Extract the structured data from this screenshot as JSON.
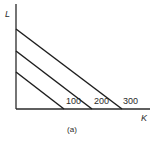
{
  "figure": {
    "caption": "(a)",
    "y_axis_label": "L",
    "x_axis_label": "K"
  },
  "chart_data": {
    "type": "line",
    "title": "",
    "xlabel": "K",
    "ylabel": "L",
    "caption": "(a)",
    "grid": false,
    "legend": "none",
    "series": [
      {
        "name": "100",
        "label": "100",
        "points": [
          [
            0,
            1
          ],
          [
            1,
            0
          ]
        ]
      },
      {
        "name": "200",
        "label": "200",
        "points": [
          [
            0,
            2
          ],
          [
            2,
            0
          ]
        ]
      },
      {
        "name": "300",
        "label": "300",
        "points": [
          [
            0,
            3
          ],
          [
            3,
            0
          ]
        ]
      }
    ]
  },
  "isoquants": [
    {
      "label": "100",
      "x1": 16,
      "y1": 72,
      "x2": 64,
      "y2": 109,
      "lx": 66,
      "ly": 104
    },
    {
      "label": "200",
      "x1": 16,
      "y1": 51,
      "x2": 92,
      "y2": 109,
      "lx": 94,
      "ly": 104
    },
    {
      "label": "300",
      "x1": 16,
      "y1": 29,
      "x2": 122,
      "y2": 109,
      "lx": 123,
      "ly": 104
    }
  ]
}
